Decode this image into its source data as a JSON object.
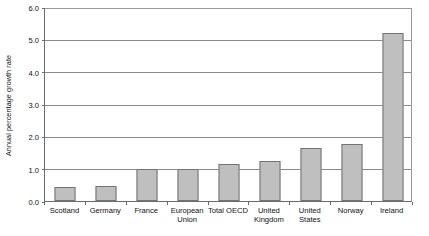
{
  "chart_data": {
    "type": "bar",
    "title": "",
    "subtitle": "",
    "xlabel": "",
    "ylabel": "Annual percentage growth rate",
    "categories": [
      "Scotland",
      "Germany",
      "France",
      "European Union",
      "Total OECD",
      "United Kingdom",
      "United States",
      "Norway",
      "Ireland"
    ],
    "values": [
      0.44,
      0.47,
      0.98,
      1.0,
      1.15,
      1.25,
      1.65,
      1.75,
      5.2
    ],
    "ylim": [
      0.0,
      6.0
    ],
    "ytick_values": [
      0.0,
      1.0,
      2.0,
      3.0,
      4.0,
      5.0,
      6.0
    ],
    "ytick_labels": [
      "0.0",
      "1.0",
      "2.0",
      "3.0",
      "4.0",
      "5.0",
      "6.0"
    ],
    "grid": true,
    "legend": false,
    "legend_position": "none",
    "bar_color": "#bfbfbf",
    "bar_border_color": "#737373",
    "gridline_color": "#8a8a8a",
    "axis_color": "#6b6b6b"
  },
  "category_label_lines": [
    [
      "Scotland"
    ],
    [
      "Germany"
    ],
    [
      "France"
    ],
    [
      "European",
      "Union"
    ],
    [
      "Total OECD"
    ],
    [
      "United",
      "Kingdom"
    ],
    [
      "United",
      "States"
    ],
    [
      "Norway"
    ],
    [
      "Ireland"
    ]
  ]
}
